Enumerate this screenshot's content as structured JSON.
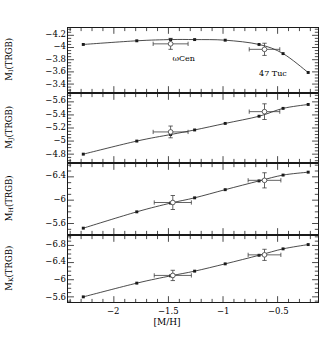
{
  "figure": {
    "xlabel": "[M/H]",
    "xticks": [
      "-2",
      "-1.5",
      "-1",
      "-0.5"
    ],
    "xtick_values": [
      -2,
      -1.5,
      -1,
      -0.5
    ],
    "xlim": [
      -2.42,
      -0.13
    ],
    "annotations": [
      {
        "text": "ωCen",
        "x": -1.44,
        "panel": 1
      },
      {
        "text": "47 Tuc",
        "x": -0.66,
        "panel": 1
      }
    ]
  },
  "panels": [
    {
      "id": "p1",
      "ylabel_main": "M",
      "ylabel_sub": "I",
      "ylabel_tail": "(TRGB)",
      "yticks": [
        "-4.2",
        "-4",
        "-3.8",
        "-3.6",
        "-3.4"
      ],
      "ytick_values": [
        -4.2,
        -4.0,
        -3.8,
        -3.6,
        -3.4
      ],
      "ylim": [
        -4.32,
        -3.27
      ]
    },
    {
      "id": "p2",
      "ylabel_main": "M",
      "ylabel_sub": "J",
      "ylabel_tail": "(TRGB)",
      "yticks": [
        "-5.6",
        "-5.4",
        "-5.2",
        "-5",
        "-4.8"
      ],
      "ytick_values": [
        -5.6,
        -5.4,
        -5.2,
        -5.0,
        -4.8
      ],
      "ylim": [
        -5.72,
        -4.68
      ]
    },
    {
      "id": "p3",
      "ylabel_main": "M",
      "ylabel_sub": "H",
      "ylabel_tail": "(TRGB)",
      "yticks": [
        "-6.4",
        "-6",
        "-5.6"
      ],
      "ytick_values": [
        -6.4,
        -6.0,
        -5.6
      ],
      "ylim": [
        -6.62,
        -5.42
      ]
    },
    {
      "id": "p4",
      "ylabel_main": "M",
      "ylabel_sub": "K",
      "ylabel_tail": "(TRGB)",
      "yticks": [
        "-6.8",
        "-6.4",
        "-6",
        "-5.6"
      ],
      "ytick_values": [
        -6.8,
        -6.4,
        -6.0,
        -5.6
      ],
      "ylim": [
        -7.02,
        -5.48
      ]
    }
  ],
  "chart_data": [
    {
      "type": "line",
      "title": "",
      "xlabel": "[M/H]",
      "ylabel": "M_I(TRGB)",
      "xlim": [
        -2.42,
        -0.13
      ],
      "ylim": [
        -4.32,
        -3.27
      ],
      "y_inverted": true,
      "grid": false,
      "legend": "none",
      "series": [
        {
          "name": "model",
          "marker": "filled-square",
          "x": [
            -2.28,
            -1.79,
            -1.48,
            -1.26,
            -0.98,
            -0.67,
            -0.45,
            -0.22
          ],
          "y": [
            -4.05,
            -4.11,
            -4.13,
            -4.13,
            -4.12,
            -4.05,
            -3.9,
            -3.59
          ]
        },
        {
          "name": "observed-clusters",
          "marker": "open-circle-with-errorbars",
          "points": [
            {
              "label": "ωCen",
              "x": -1.48,
              "y": -4.06,
              "xerr": 0.16,
              "yerr": 0.09
            },
            {
              "label": "47 Tuc",
              "x": -0.62,
              "y": -3.97,
              "xerr": 0.14,
              "yerr": 0.1
            }
          ]
        }
      ]
    },
    {
      "type": "line",
      "title": "",
      "xlabel": "[M/H]",
      "ylabel": "M_J(TRGB)",
      "xlim": [
        -2.42,
        -0.13
      ],
      "ylim": [
        -5.72,
        -4.68
      ],
      "y_inverted": true,
      "grid": false,
      "legend": "none",
      "series": [
        {
          "name": "model",
          "marker": "filled-square",
          "x": [
            -2.28,
            -1.79,
            -1.48,
            -1.26,
            -0.98,
            -0.67,
            -0.45,
            -0.22
          ],
          "y": [
            -4.8,
            -5.0,
            -5.1,
            -5.17,
            -5.27,
            -5.38,
            -5.5,
            -5.56
          ]
        },
        {
          "name": "observed-clusters",
          "marker": "open-circle-with-errorbars",
          "points": [
            {
              "label": "ωCen",
              "x": -1.48,
              "y": -5.14,
              "xerr": 0.16,
              "yerr": 0.09
            },
            {
              "label": "47 Tuc",
              "x": -0.62,
              "y": -5.45,
              "xerr": 0.14,
              "yerr": 0.12
            }
          ]
        }
      ]
    },
    {
      "type": "line",
      "title": "",
      "xlabel": "[M/H]",
      "ylabel": "M_H(TRGB)",
      "xlim": [
        -2.42,
        -0.13
      ],
      "ylim": [
        -6.62,
        -5.42
      ],
      "y_inverted": true,
      "grid": false,
      "legend": "none",
      "series": [
        {
          "name": "model",
          "marker": "filled-square",
          "x": [
            -2.28,
            -1.79,
            -1.48,
            -1.26,
            -0.98,
            -0.67,
            -0.45,
            -0.22
          ],
          "y": [
            -5.52,
            -5.8,
            -5.95,
            -6.04,
            -6.18,
            -6.33,
            -6.43,
            -6.48
          ]
        },
        {
          "name": "observed-clusters",
          "marker": "open-circle-with-errorbars",
          "points": [
            {
              "label": "ωCen",
              "x": -1.46,
              "y": -5.96,
              "xerr": 0.17,
              "yerr": 0.12
            },
            {
              "label": "47 Tuc",
              "x": -0.62,
              "y": -6.34,
              "xerr": 0.15,
              "yerr": 0.13
            }
          ]
        }
      ]
    },
    {
      "type": "line",
      "title": "",
      "xlabel": "[M/H]",
      "ylabel": "M_K(TRGB)",
      "xlim": [
        -2.42,
        -0.13
      ],
      "ylim": [
        -7.02,
        -5.48
      ],
      "y_inverted": true,
      "grid": false,
      "legend": "none",
      "series": [
        {
          "name": "model",
          "marker": "filled-square",
          "x": [
            -2.28,
            -1.79,
            -1.48,
            -1.26,
            -0.98,
            -0.67,
            -0.45,
            -0.22
          ],
          "y": [
            -5.6,
            -5.92,
            -6.09,
            -6.2,
            -6.37,
            -6.57,
            -6.72,
            -6.82
          ]
        },
        {
          "name": "observed-clusters",
          "marker": "open-circle-with-errorbars",
          "points": [
            {
              "label": "ωCen",
              "x": -1.46,
              "y": -6.1,
              "xerr": 0.17,
              "yerr": 0.12
            },
            {
              "label": "47 Tuc",
              "x": -0.62,
              "y": -6.58,
              "xerr": 0.15,
              "yerr": 0.13
            }
          ]
        }
      ]
    }
  ]
}
